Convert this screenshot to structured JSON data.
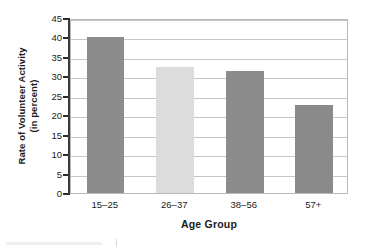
{
  "chart_data": {
    "type": "bar",
    "title": "",
    "xlabel": "Age Group",
    "ylabel": "Rate of Volunteer Activity (in percent)",
    "ylabel_lines": [
      "Rate of Volunteer Activity",
      "(in percent)"
    ],
    "categories": [
      "15–25",
      "26–37",
      "38–56",
      "57+"
    ],
    "values": [
      40.0,
      32.5,
      31.3,
      22.6
    ],
    "bar_colors": [
      "#8c8c8c",
      "#dcdcdc",
      "#8c8c8c",
      "#8a8a8a"
    ],
    "ylim": [
      0,
      45
    ],
    "yticks": [
      0,
      5,
      10,
      15,
      20,
      25,
      30,
      35,
      40,
      45
    ],
    "ytick_labels": [
      "0",
      "5",
      "10",
      "15",
      "20",
      "25",
      "30",
      "35",
      "40",
      "45"
    ],
    "grid": true,
    "grid_axis": "y",
    "legend": false,
    "legend_position": "none"
  },
  "style": {
    "plot_border_color": "#b9b9b9",
    "gridline_color": "#c6c6c6",
    "axis_color": "#3a3a3a",
    "text_color": "#1b1b1b",
    "background": "#ffffff"
  }
}
